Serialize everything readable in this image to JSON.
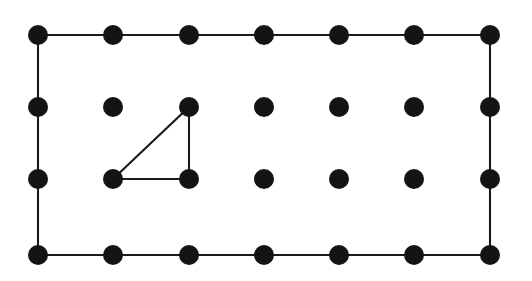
{
  "figure": {
    "title": "Geoboard lattice with rectangle outline and inscribed right triangle",
    "background_color": "#ffffff",
    "dot_color": "#141414",
    "line_color": "#1a1a1a",
    "dot_radius": 10,
    "line_width": 2.1,
    "canvas": {
      "width": 532,
      "height": 281
    }
  },
  "chart_data": {
    "type": "scatter",
    "title": "",
    "xlabel": "",
    "ylabel": "",
    "grid": false,
    "legend": null,
    "lattice": {
      "columns": 7,
      "rows": 4,
      "column_x": [
        38,
        113,
        189,
        264,
        339,
        414,
        490
      ],
      "row_y": [
        35,
        107,
        179,
        255
      ],
      "column_spacing": 75.3,
      "row_spacing_top": 72,
      "row_spacing_middle": 72,
      "row_spacing_bottom": 76
    },
    "points": [
      {
        "id": "r0c0",
        "col": 0,
        "row": 0,
        "x": 38,
        "y": 35
      },
      {
        "id": "r0c1",
        "col": 1,
        "row": 0,
        "x": 113,
        "y": 35
      },
      {
        "id": "r0c2",
        "col": 2,
        "row": 0,
        "x": 189,
        "y": 35
      },
      {
        "id": "r0c3",
        "col": 3,
        "row": 0,
        "x": 264,
        "y": 35
      },
      {
        "id": "r0c4",
        "col": 4,
        "row": 0,
        "x": 339,
        "y": 35
      },
      {
        "id": "r0c5",
        "col": 5,
        "row": 0,
        "x": 414,
        "y": 35
      },
      {
        "id": "r0c6",
        "col": 6,
        "row": 0,
        "x": 490,
        "y": 35
      },
      {
        "id": "r1c0",
        "col": 0,
        "row": 1,
        "x": 38,
        "y": 107
      },
      {
        "id": "r1c1",
        "col": 1,
        "row": 1,
        "x": 113,
        "y": 107
      },
      {
        "id": "r1c2",
        "col": 2,
        "row": 1,
        "x": 189,
        "y": 107
      },
      {
        "id": "r1c3",
        "col": 3,
        "row": 1,
        "x": 264,
        "y": 107
      },
      {
        "id": "r1c4",
        "col": 4,
        "row": 1,
        "x": 339,
        "y": 107
      },
      {
        "id": "r1c5",
        "col": 5,
        "row": 1,
        "x": 414,
        "y": 107
      },
      {
        "id": "r1c6",
        "col": 6,
        "row": 1,
        "x": 490,
        "y": 107
      },
      {
        "id": "r2c0",
        "col": 0,
        "row": 2,
        "x": 38,
        "y": 179
      },
      {
        "id": "r2c1",
        "col": 1,
        "row": 2,
        "x": 113,
        "y": 179
      },
      {
        "id": "r2c2",
        "col": 2,
        "row": 2,
        "x": 189,
        "y": 179
      },
      {
        "id": "r2c3",
        "col": 3,
        "row": 2,
        "x": 264,
        "y": 179
      },
      {
        "id": "r2c4",
        "col": 4,
        "row": 2,
        "x": 339,
        "y": 179
      },
      {
        "id": "r2c5",
        "col": 5,
        "row": 2,
        "x": 414,
        "y": 179
      },
      {
        "id": "r2c6",
        "col": 6,
        "row": 2,
        "x": 490,
        "y": 179
      },
      {
        "id": "r3c0",
        "col": 0,
        "row": 3,
        "x": 38,
        "y": 255
      },
      {
        "id": "r3c1",
        "col": 1,
        "row": 3,
        "x": 113,
        "y": 255
      },
      {
        "id": "r3c2",
        "col": 2,
        "row": 3,
        "x": 189,
        "y": 255
      },
      {
        "id": "r3c3",
        "col": 3,
        "row": 3,
        "x": 264,
        "y": 255
      },
      {
        "id": "r3c4",
        "col": 4,
        "row": 3,
        "x": 339,
        "y": 255
      },
      {
        "id": "r3c5",
        "col": 5,
        "row": 3,
        "x": 414,
        "y": 255
      },
      {
        "id": "r3c6",
        "col": 6,
        "row": 3,
        "x": 490,
        "y": 255
      }
    ],
    "shapes": [
      {
        "name": "rectangle-outline",
        "kind": "polygon",
        "closed": true,
        "vertices": [
          "r0c0",
          "r0c6",
          "r3c6",
          "r3c0"
        ],
        "path": "M 38 35 L 490 35 L 490 255 L 38 255 Z",
        "width_units": 6,
        "height_units": 3
      },
      {
        "name": "right-triangle",
        "kind": "polygon",
        "closed": true,
        "vertices": [
          "r2c1",
          "r1c2",
          "r2c2"
        ],
        "path": "M 113 179 L 189 107 L 189 179 Z",
        "legs_units": [
          1,
          1
        ],
        "right_angle_at": "r2c2"
      }
    ]
  }
}
